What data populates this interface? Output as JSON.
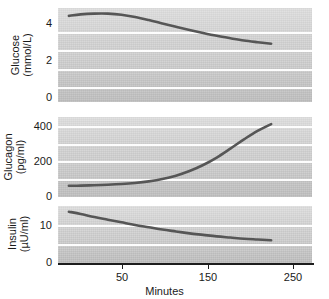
{
  "chart_data": [
    {
      "type": "line",
      "panel_id": "glucose",
      "title": "",
      "ylabel": "Glucose\n(mmol/L)",
      "ylabel_line1": "Glucose",
      "ylabel_line2": "(mmol/L)",
      "xlabel": "",
      "yticks": [
        0,
        2,
        4
      ],
      "ytick_labels": [
        "0",
        "2",
        "4"
      ],
      "ylim": [
        0,
        5
      ],
      "xlim": [
        0,
        280
      ],
      "gridlines": [
        1,
        2,
        3,
        4
      ],
      "grid": true,
      "legend": "none",
      "series": [
        {
          "name": "Glucose",
          "color": "#565656",
          "x": [
            12,
            25,
            40,
            55,
            70,
            85,
            100,
            115,
            130,
            145,
            160,
            175,
            190,
            205,
            220,
            235
          ],
          "values": [
            4.58,
            4.66,
            4.7,
            4.7,
            4.64,
            4.52,
            4.36,
            4.18,
            4.0,
            3.83,
            3.67,
            3.52,
            3.39,
            3.27,
            3.18,
            3.1
          ]
        }
      ]
    },
    {
      "type": "line",
      "panel_id": "glucagon",
      "title": "",
      "ylabel": "Glucagon\n(pg/ml)",
      "ylabel_line1": "Glucagon",
      "ylabel_line2": "(pg/ml)",
      "xlabel": "",
      "yticks": [
        0,
        200,
        400
      ],
      "ytick_labels": [
        "0",
        "200",
        "400"
      ],
      "ylim": [
        0,
        450
      ],
      "xlim": [
        0,
        280
      ],
      "gridlines": [
        100,
        200,
        300,
        400
      ],
      "grid": true,
      "legend": "none",
      "series": [
        {
          "name": "Glucagon",
          "color": "#565656",
          "x": [
            12,
            25,
            40,
            55,
            70,
            85,
            100,
            115,
            130,
            145,
            160,
            175,
            190,
            205,
            220,
            235
          ],
          "values": [
            63,
            64,
            66,
            69,
            73,
            79,
            88,
            101,
            120,
            146,
            180,
            222,
            272,
            324,
            372,
            410
          ]
        }
      ]
    },
    {
      "type": "line",
      "panel_id": "insulin",
      "title": "",
      "ylabel": "Insulin\n(µU/ml)",
      "ylabel_line1": "Insulin",
      "ylabel_line2": "(µU/ml)",
      "xlabel": "Minutes",
      "yticks": [
        0,
        10
      ],
      "ytick_labels": [
        "0",
        "10"
      ],
      "ylim": [
        0,
        15
      ],
      "xlim": [
        0,
        280
      ],
      "gridlines": [
        5,
        10
      ],
      "grid": true,
      "legend": "none",
      "xticks": [
        50,
        150,
        250
      ],
      "xtick_labels": [
        "50",
        "150",
        "250"
      ],
      "series": [
        {
          "name": "Insulin",
          "color": "#565656",
          "x": [
            12,
            25,
            40,
            55,
            70,
            85,
            100,
            115,
            130,
            145,
            160,
            175,
            190,
            205,
            220,
            235
          ],
          "values": [
            13.5,
            12.9,
            12.1,
            11.4,
            10.7,
            10.0,
            9.4,
            8.8,
            8.3,
            7.8,
            7.4,
            7.0,
            6.7,
            6.4,
            6.2,
            6.0
          ]
        }
      ]
    }
  ],
  "axes": {
    "x_label": "Minutes",
    "x_tick_labels": [
      "50",
      "150",
      "250"
    ]
  },
  "panels": {
    "glucose": {
      "y_label_line1": "Glucose",
      "y_label_line2": "(mmol/L)",
      "y_tick_labels": [
        "4",
        "2",
        "0"
      ]
    },
    "glucagon": {
      "y_label_line1": "Glucagon",
      "y_label_line2": "(pg/ml)",
      "y_tick_labels": [
        "400",
        "200",
        "0"
      ]
    },
    "insulin": {
      "y_label_line1": "Insulin",
      "y_label_line2": "(µU/ml)",
      "y_tick_labels": [
        "10",
        "0"
      ]
    }
  },
  "colors": {
    "curve": "#565656",
    "plot_background": "#d2d2d2",
    "gridline": "#fdfdfd",
    "axis": "#1d1d1d",
    "text": "#1a1a1a",
    "page_background": "#ffffff"
  }
}
